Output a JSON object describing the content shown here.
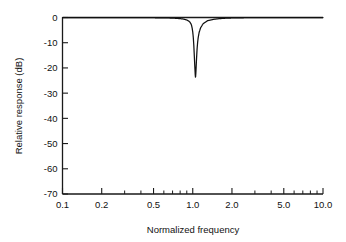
{
  "chart_data": {
    "type": "line",
    "title": "",
    "subtitle": "",
    "xlabel": "Normalized frequency",
    "ylabel": "Relative response (dB)",
    "xscale": "log",
    "yscale": "linear",
    "xlim": [
      0.1,
      10.0
    ],
    "ylim": [
      -70,
      0
    ],
    "grid": false,
    "legend": null,
    "legend_position": "none",
    "xticks": [
      0.1,
      0.2,
      0.5,
      1.0,
      2.0,
      5.0,
      10.0
    ],
    "xtick_labels": [
      "0.1",
      "0.2",
      "0.5",
      "1.0",
      "2.0",
      "5.0",
      "10.0"
    ],
    "xminor_ticks": [
      0.3,
      0.4,
      0.6,
      0.7,
      0.8,
      0.9,
      3.0,
      4.0,
      6.0,
      7.0,
      8.0,
      9.0
    ],
    "yticks": [
      0,
      -10,
      -20,
      -30,
      -40,
      -50,
      -60,
      -70
    ],
    "ytick_labels": [
      "0",
      "-10",
      "-20",
      "-30",
      "-40",
      "-50",
      "-60",
      "-70"
    ],
    "notch_center": 1.05,
    "notch_depth_db": -53,
    "notch_q": 42,
    "series": [
      {
        "name": "Notch filter response",
        "color": "#111111",
        "x": [
          0.1,
          0.12,
          0.15,
          0.18,
          0.22,
          0.27,
          0.33,
          0.4,
          0.5,
          0.6,
          0.7,
          0.8,
          0.85,
          0.9,
          0.93,
          0.95,
          0.97,
          0.98,
          0.99,
          1.0,
          1.01,
          1.02,
          1.03,
          1.04,
          1.045,
          1.05,
          1.055,
          1.06,
          1.07,
          1.08,
          1.09,
          1.1,
          1.12,
          1.15,
          1.2,
          1.3,
          1.45,
          1.6,
          1.8,
          2.0,
          2.5,
          3.0,
          4.0,
          5.0,
          6.5,
          8.0,
          10.0
        ],
        "y": [
          0.0,
          0.0,
          0.0,
          0.0,
          0.0,
          0.0,
          -0.1,
          -0.1,
          -0.2,
          -0.3,
          -0.5,
          -1.0,
          -1.4,
          -2.2,
          -3.1,
          -4.0,
          -5.7,
          -7.1,
          -9.5,
          -12.8,
          -17.8,
          -25.5,
          -36.0,
          -46.0,
          -50.5,
          -53.0,
          -50.0,
          -45.5,
          -35.5,
          -27.5,
          -22.0,
          -18.0,
          -13.0,
          -9.0,
          -5.5,
          -2.8,
          -1.6,
          -1.0,
          -0.6,
          -0.4,
          -0.2,
          -0.1,
          -0.1,
          0.0,
          0.0,
          0.0,
          0.0
        ]
      }
    ]
  },
  "axes": {
    "y_axis_title": "Relative response (dB)",
    "x_axis_title": "Normalized frequency"
  }
}
